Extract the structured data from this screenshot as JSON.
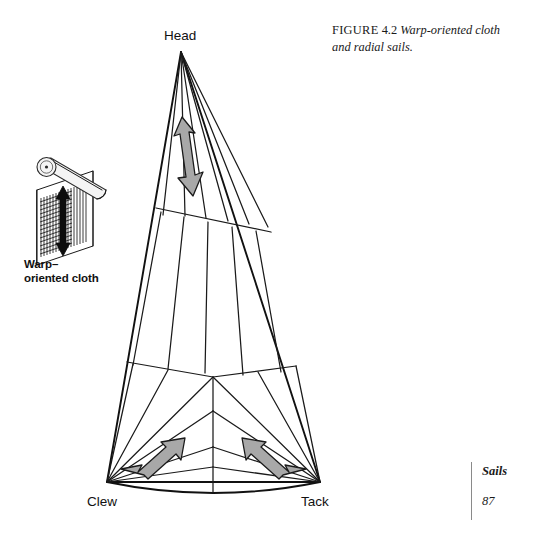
{
  "figure": {
    "label": "FIGURE",
    "number": "4.2",
    "caption": "Warp-oriented cloth and radial sails.",
    "full_caption": "FIGURE 4.2 Warp-oriented cloth and radial sails."
  },
  "footer": {
    "book_section": "Sails",
    "page_number": "87"
  },
  "sail": {
    "corner_labels": {
      "head": "Head",
      "clew": "Clew",
      "tack": "Tack"
    }
  },
  "cloth_roll": {
    "label_line1": "Warp–",
    "label_line2": "oriented cloth",
    "label": "Warp–oriented cloth"
  },
  "colors": {
    "ink": "#111111",
    "line": "#1a1a1a",
    "arrow_fill": "#a8a8a8",
    "arrow_stroke": "#1a1a1a",
    "roll_fill": "#f2f2f2",
    "rule": "#8a8a8a",
    "background": "#ffffff"
  }
}
